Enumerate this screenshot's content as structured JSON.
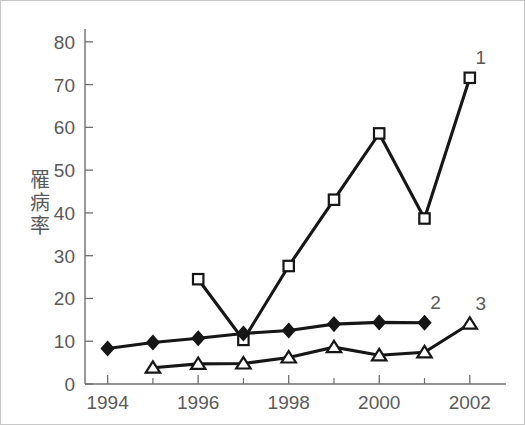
{
  "chart_data": {
    "type": "line",
    "title": "",
    "subtitle": "",
    "xlabel": "",
    "ylabel": "罹病率",
    "ylabel_chars": [
      "罹",
      "病",
      "率"
    ],
    "xlim": [
      1993.5,
      2002.8
    ],
    "ylim": [
      0,
      83
    ],
    "yticks": [
      0,
      10,
      20,
      30,
      40,
      50,
      60,
      70,
      80
    ],
    "ytick_labels": [
      "0",
      "10",
      "20",
      "30",
      "40",
      "50",
      "60",
      "70",
      "80"
    ],
    "xticks": [
      1994,
      1996,
      1998,
      2000,
      2002
    ],
    "xtick_labels": [
      "1994",
      "1996",
      "1998",
      "2000",
      "2002"
    ],
    "x_minor_ticks": [
      1995,
      1997,
      1999,
      2001
    ],
    "grid": false,
    "legend_position": "inline-right-of-last-point",
    "series": [
      {
        "name": "1",
        "label": "1",
        "marker": "open-square",
        "color": "#161616",
        "x": [
          1996,
          1997,
          1998,
          1999,
          2000,
          2001,
          2002
        ],
        "values": [
          24.5,
          10.3,
          27.6,
          43.1,
          58.6,
          38.7,
          71.6
        ]
      },
      {
        "name": "2",
        "label": "2",
        "marker": "filled-diamond",
        "color": "#161616",
        "x": [
          1994,
          1995,
          1996,
          1997,
          1998,
          1999,
          2000,
          2001
        ],
        "values": [
          8.3,
          9.7,
          10.7,
          11.8,
          12.5,
          14.0,
          14.4,
          14.3
        ]
      },
      {
        "name": "3",
        "label": "3",
        "marker": "open-triangle",
        "color": "#161616",
        "x": [
          1995,
          1996,
          1997,
          1998,
          1999,
          2000,
          2001,
          2002
        ],
        "values": [
          3.8,
          4.7,
          4.8,
          6.2,
          8.6,
          6.7,
          7.4,
          14.1
        ]
      }
    ]
  },
  "series_labels": {
    "one": "1",
    "two": "2",
    "three": "3"
  }
}
